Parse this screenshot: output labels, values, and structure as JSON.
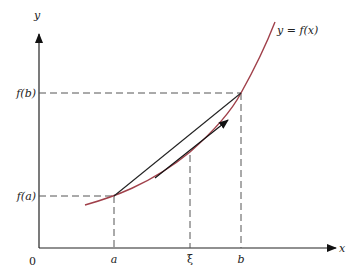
{
  "diagram": {
    "axes": {
      "x_label": "x",
      "y_label": "y",
      "origin_label": "0"
    },
    "curve_label": "y = f(x)",
    "x_ticks": [
      {
        "label": "a"
      },
      {
        "label": "ξ"
      },
      {
        "label": "b"
      }
    ],
    "y_ticks": [
      {
        "label": "f(a)"
      },
      {
        "label": "f(b)"
      }
    ],
    "colors": {
      "curve": "#a0404a",
      "axes": "#222222",
      "secant": "#222222",
      "dashes": "#555555"
    }
  }
}
